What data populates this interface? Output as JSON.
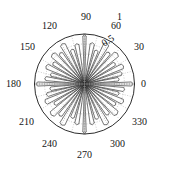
{
  "figure": {
    "kind": "polar-plot",
    "background_color": "#ffffff",
    "foreground_color": "#151515",
    "grid_color": "#9a9a9a",
    "data_color": "#2b2b2b",
    "center_x": 84.5,
    "center_y": 84.0,
    "radius_px": 50.0
  },
  "chart_data": {
    "type": "line",
    "subtype": "polar-rose",
    "title": "",
    "xlabel": "",
    "ylabel": "",
    "grid": true,
    "legend": null,
    "theta_unit": "degrees",
    "theta_tick_labels": [
      "0",
      "30",
      "60",
      "90",
      "120",
      "150",
      "180",
      "210",
      "240",
      "270",
      "300",
      "330"
    ],
    "theta_ticks": [
      0,
      30,
      60,
      90,
      120,
      150,
      180,
      210,
      240,
      270,
      300,
      330
    ],
    "theta_gridline_step": 15,
    "r_tick_labels": [
      "0.5",
      "1"
    ],
    "r_ticks": [
      0.5,
      1.0
    ],
    "rlim": [
      0,
      1
    ],
    "r_gridline_circles": [
      0.2,
      0.4,
      0.6,
      0.8,
      1.0
    ],
    "r_label_angle": 72,
    "series": [
      {
        "name": "lobe-pattern",
        "description": "narrow radial lobes emanating from the origin",
        "lobes": [
          {
            "theta": 0,
            "r": 0.97,
            "half_width": 2.5
          },
          {
            "theta": 8,
            "r": 0.7,
            "half_width": 3.0
          },
          {
            "theta": 16,
            "r": 0.78,
            "half_width": 3.0
          },
          {
            "theta": 25,
            "r": 0.86,
            "half_width": 3.5
          },
          {
            "theta": 34,
            "r": 0.74,
            "half_width": 3.0
          },
          {
            "theta": 43,
            "r": 0.9,
            "half_width": 4.0
          },
          {
            "theta": 52,
            "r": 0.8,
            "half_width": 3.0
          },
          {
            "theta": 61,
            "r": 0.93,
            "half_width": 3.5
          },
          {
            "theta": 70,
            "r": 0.72,
            "half_width": 3.0
          },
          {
            "theta": 79,
            "r": 0.84,
            "half_width": 3.0
          },
          {
            "theta": 90,
            "r": 0.99,
            "half_width": 2.0
          },
          {
            "theta": 101,
            "r": 0.82,
            "half_width": 3.0
          },
          {
            "theta": 110,
            "r": 0.74,
            "half_width": 3.0
          },
          {
            "theta": 119,
            "r": 0.92,
            "half_width": 3.5
          },
          {
            "theta": 128,
            "r": 0.79,
            "half_width": 3.0
          },
          {
            "theta": 137,
            "r": 0.88,
            "half_width": 4.0
          },
          {
            "theta": 146,
            "r": 0.76,
            "half_width": 3.0
          },
          {
            "theta": 155,
            "r": 0.85,
            "half_width": 3.5
          },
          {
            "theta": 164,
            "r": 0.71,
            "half_width": 3.0
          },
          {
            "theta": 172,
            "r": 0.8,
            "half_width": 3.0
          },
          {
            "theta": 180,
            "r": 0.97,
            "half_width": 2.5
          },
          {
            "theta": 188,
            "r": 0.7,
            "half_width": 3.0
          },
          {
            "theta": 196,
            "r": 0.79,
            "half_width": 3.0
          },
          {
            "theta": 205,
            "r": 0.87,
            "half_width": 3.5
          },
          {
            "theta": 214,
            "r": 0.73,
            "half_width": 3.0
          },
          {
            "theta": 223,
            "r": 0.91,
            "half_width": 4.0
          },
          {
            "theta": 232,
            "r": 0.81,
            "half_width": 3.0
          },
          {
            "theta": 241,
            "r": 0.94,
            "half_width": 3.5
          },
          {
            "theta": 250,
            "r": 0.73,
            "half_width": 3.0
          },
          {
            "theta": 259,
            "r": 0.83,
            "half_width": 3.0
          },
          {
            "theta": 270,
            "r": 0.99,
            "half_width": 2.0
          },
          {
            "theta": 281,
            "r": 0.83,
            "half_width": 3.0
          },
          {
            "theta": 290,
            "r": 0.75,
            "half_width": 3.0
          },
          {
            "theta": 299,
            "r": 0.93,
            "half_width": 3.5
          },
          {
            "theta": 308,
            "r": 0.78,
            "half_width": 3.0
          },
          {
            "theta": 317,
            "r": 0.89,
            "half_width": 4.0
          },
          {
            "theta": 326,
            "r": 0.75,
            "half_width": 3.0
          },
          {
            "theta": 335,
            "r": 0.86,
            "half_width": 3.5
          },
          {
            "theta": 344,
            "r": 0.72,
            "half_width": 3.0
          },
          {
            "theta": 352,
            "r": 0.81,
            "half_width": 3.0
          }
        ]
      }
    ]
  },
  "labels": {
    "theta": [
      {
        "text": "0",
        "x": 141,
        "y": 79
      },
      {
        "text": "30",
        "x": 134,
        "y": 42
      },
      {
        "text": "60",
        "x": 111,
        "y": 21
      },
      {
        "text": "90",
        "x": 81,
        "y": 12
      },
      {
        "text": "120",
        "x": 42,
        "y": 21
      },
      {
        "text": "150",
        "x": 20,
        "y": 42
      },
      {
        "text": "180",
        "x": 6,
        "y": 79
      },
      {
        "text": "210",
        "x": 19,
        "y": 117
      },
      {
        "text": "240",
        "x": 42,
        "y": 139
      },
      {
        "text": "270",
        "x": 77,
        "y": 150
      },
      {
        "text": "300",
        "x": 110,
        "y": 139
      },
      {
        "text": "330",
        "x": 132,
        "y": 117
      }
    ],
    "radial": [
      {
        "text": "1",
        "x": 117,
        "y": 12
      },
      {
        "text": "0.5",
        "x": 100,
        "y": 40
      }
    ]
  }
}
